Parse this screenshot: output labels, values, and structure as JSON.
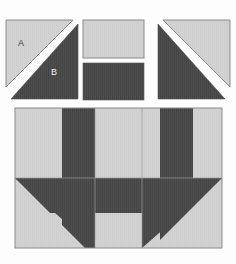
{
  "figure": {
    "kind": "quilt-block-construction-diagram",
    "background_color": "#fdfdfd"
  },
  "palette": {
    "light_fabric": "#d2d2d2",
    "dark_fabric": "#4d4d4d",
    "outline": "#8a8a8a",
    "seam_gap": "#ffffff",
    "label_on_light": "#3a3a3a",
    "label_on_dark": "#f2f2f2"
  },
  "labels": {
    "a": "A",
    "b": "B"
  },
  "units_row": {
    "name": "cut-pieces-row",
    "pieces": [
      {
        "name": "half-square-triangle-unit-left",
        "light_label": "A",
        "dark_label": "B",
        "light_position": "upper-left",
        "dark_position": "lower-right"
      },
      {
        "name": "rectangle-unit-light",
        "fabric": "light"
      },
      {
        "name": "rectangle-unit-dark",
        "fabric": "dark"
      },
      {
        "name": "half-square-triangle-unit-right",
        "light_position": "upper-right",
        "dark_position": "lower-left"
      }
    ]
  },
  "assembled_block": {
    "name": "assembled-quilt-block",
    "columns": 3,
    "rows": 2,
    "description": "assembled block with inward pointing corner triangles, vertical dark bars and central dark cross"
  }
}
